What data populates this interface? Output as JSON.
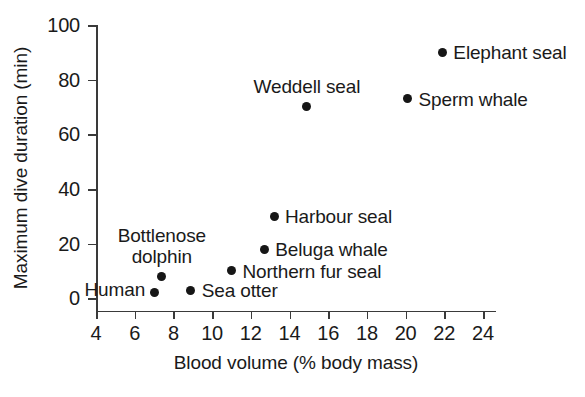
{
  "chart_data": {
    "type": "scatter",
    "title": "",
    "xlabel": "Blood volume (% body mass)",
    "ylabel": "Maximum dive duration (min)",
    "xlim": [
      4,
      24
    ],
    "ylim": [
      0,
      100
    ],
    "xticks": [
      4,
      6,
      8,
      10,
      12,
      14,
      16,
      18,
      20,
      22,
      24
    ],
    "yticks": [
      0,
      20,
      40,
      60,
      80,
      100
    ],
    "grid": false,
    "legend": "none",
    "marker_color": "#161616",
    "axis_color": "#3a3a3a",
    "points": [
      {
        "label": "Human",
        "x": 7.0,
        "y": 2,
        "label_pos": "left"
      },
      {
        "label": "Bottlenose\ndolphin",
        "x": 7.4,
        "y": 8,
        "label_pos": "above"
      },
      {
        "label": "Sea otter",
        "x": 8.9,
        "y": 3,
        "label_pos": "right"
      },
      {
        "label": "Northern fur seal",
        "x": 11.0,
        "y": 10,
        "label_pos": "right"
      },
      {
        "label": "Beluga whale",
        "x": 12.7,
        "y": 18,
        "label_pos": "right"
      },
      {
        "label": "Harbour seal",
        "x": 13.2,
        "y": 30,
        "label_pos": "right"
      },
      {
        "label": "Weddell seal",
        "x": 14.9,
        "y": 70,
        "label_pos": "above"
      },
      {
        "label": "Sperm whale",
        "x": 20.1,
        "y": 73,
        "label_pos": "right"
      },
      {
        "label": "Elephant seal",
        "x": 21.9,
        "y": 90,
        "label_pos": "right"
      }
    ]
  }
}
